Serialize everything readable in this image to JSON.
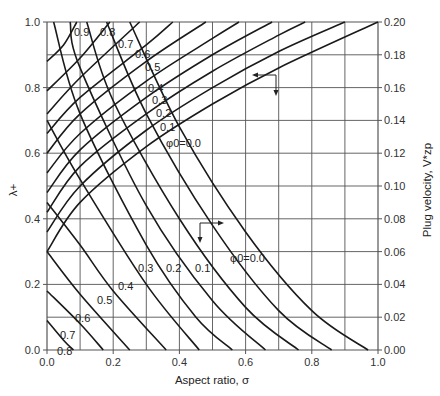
{
  "chart_data": {
    "type": "line",
    "title": "",
    "xlabel": "Aspect ratio, σ",
    "ylabel": "λ+",
    "ylabel_right": "Plug velocity, V*zp",
    "xlim": [
      0.0,
      1.0
    ],
    "ylim": [
      0.0,
      1.0
    ],
    "ylim_right": [
      0.0,
      0.2
    ],
    "grid": true,
    "x_ticks": [
      "0.0",
      "0.2",
      "0.4",
      "0.6",
      "0.8",
      "1.0"
    ],
    "y_ticks": [
      "0.0",
      "0.2",
      "0.4",
      "0.6",
      "0.8",
      "1.0"
    ],
    "y_right_ticks": [
      "0.00",
      "0.02",
      "0.04",
      "0.06",
      "0.08",
      "0.10",
      "0.12",
      "0.14",
      "0.16",
      "0.18",
      "0.20"
    ],
    "families": [
      {
        "name": "Plug velocity V*zp (right axis)",
        "arrow": "left",
        "series": [
          {
            "name": "φ0=0.0",
            "points": [
              [
                0.0,
                0.3
              ],
              [
                0.1,
                0.45
              ],
              [
                0.3,
                0.62
              ],
              [
                0.5,
                0.75
              ],
              [
                0.7,
                0.86
              ],
              [
                1.0,
                1.0
              ]
            ]
          },
          {
            "name": "0.1",
            "points": [
              [
                0.0,
                0.36
              ],
              [
                0.1,
                0.5
              ],
              [
                0.3,
                0.67
              ],
              [
                0.5,
                0.8
              ],
              [
                0.7,
                0.91
              ],
              [
                0.9,
                1.0
              ]
            ]
          },
          {
            "name": "0.2",
            "points": [
              [
                0.0,
                0.42
              ],
              [
                0.1,
                0.56
              ],
              [
                0.3,
                0.72
              ],
              [
                0.5,
                0.85
              ],
              [
                0.7,
                0.96
              ],
              [
                0.78,
                1.0
              ]
            ]
          },
          {
            "name": "0.3",
            "points": [
              [
                0.0,
                0.48
              ],
              [
                0.1,
                0.61
              ],
              [
                0.3,
                0.77
              ],
              [
                0.5,
                0.9
              ],
              [
                0.68,
                1.0
              ]
            ]
          },
          {
            "name": "0.4",
            "points": [
              [
                0.0,
                0.54
              ],
              [
                0.1,
                0.66
              ],
              [
                0.3,
                0.82
              ],
              [
                0.5,
                0.95
              ],
              [
                0.58,
                1.0
              ]
            ]
          },
          {
            "name": "0.5",
            "points": [
              [
                0.0,
                0.6
              ],
              [
                0.1,
                0.72
              ],
              [
                0.3,
                0.88
              ],
              [
                0.48,
                1.0
              ]
            ]
          },
          {
            "name": "0.6",
            "points": [
              [
                0.0,
                0.66
              ],
              [
                0.1,
                0.77
              ],
              [
                0.3,
                0.93
              ],
              [
                0.38,
                1.0
              ]
            ]
          },
          {
            "name": "0.7",
            "points": [
              [
                0.0,
                0.72
              ],
              [
                0.1,
                0.83
              ],
              [
                0.28,
                1.0
              ]
            ]
          },
          {
            "name": "0.8",
            "points": [
              [
                0.0,
                0.79
              ],
              [
                0.1,
                0.89
              ],
              [
                0.19,
                1.0
              ]
            ]
          },
          {
            "name": "0.9",
            "points": [
              [
                0.0,
                0.88
              ],
              [
                0.05,
                0.93
              ],
              [
                0.09,
                1.0
              ]
            ]
          }
        ]
      },
      {
        "name": "λ+ (left axis)",
        "arrow": "down",
        "series": [
          {
            "name": "φ0=0.0",
            "points": [
              [
                0.25,
                1.0
              ],
              [
                0.4,
                0.68
              ],
              [
                0.6,
                0.36
              ],
              [
                0.8,
                0.12
              ],
              [
                0.97,
                0.0
              ]
            ]
          },
          {
            "name": "0.1",
            "points": [
              [
                0.18,
                1.0
              ],
              [
                0.3,
                0.72
              ],
              [
                0.5,
                0.38
              ],
              [
                0.7,
                0.12
              ],
              [
                0.86,
                0.0
              ]
            ]
          },
          {
            "name": "0.2",
            "points": [
              [
                0.12,
                1.0
              ],
              [
                0.2,
                0.76
              ],
              [
                0.4,
                0.4
              ],
              [
                0.6,
                0.13
              ],
              [
                0.76,
                0.0
              ]
            ]
          },
          {
            "name": "0.3",
            "points": [
              [
                0.07,
                1.0
              ],
              [
                0.1,
                0.86
              ],
              [
                0.3,
                0.44
              ],
              [
                0.5,
                0.15
              ],
              [
                0.66,
                0.0
              ]
            ]
          },
          {
            "name": "0.4",
            "points": [
              [
                0.02,
                1.0
              ],
              [
                0.1,
                0.72
              ],
              [
                0.3,
                0.32
              ],
              [
                0.45,
                0.1
              ],
              [
                0.56,
                0.0
              ]
            ]
          },
          {
            "name": "0.5",
            "points": [
              [
                0.0,
                0.7
              ],
              [
                0.1,
                0.52
              ],
              [
                0.3,
                0.2
              ],
              [
                0.46,
                0.0
              ]
            ]
          },
          {
            "name": "0.6",
            "points": [
              [
                0.0,
                0.45
              ],
              [
                0.1,
                0.32
              ],
              [
                0.2,
                0.18
              ],
              [
                0.36,
                0.0
              ]
            ]
          },
          {
            "name": "0.7",
            "points": [
              [
                0.0,
                0.3
              ],
              [
                0.1,
                0.17
              ],
              [
                0.25,
                0.0
              ]
            ]
          },
          {
            "name": "0.8",
            "points": [
              [
                0.0,
                0.18
              ],
              [
                0.1,
                0.08
              ],
              [
                0.17,
                0.0
              ]
            ]
          },
          {
            "name": "0.9",
            "points": [
              [
                0.0,
                0.09
              ],
              [
                0.05,
                0.03
              ],
              [
                0.08,
                0.0
              ]
            ]
          }
        ]
      }
    ],
    "annotations": [
      "φ0=0.0 (upper family label)",
      "φ0=0.0 (lower family label)",
      "arrow left: read right axis",
      "arrow down: read σ axis"
    ]
  },
  "labels": {
    "x_axis": "Aspect ratio, σ",
    "y_axis_left": "λ+",
    "y_axis_right": "Plug velocity, V*zp",
    "upper_labels": [
      "0.9",
      "0.8",
      "0.7",
      "0.6",
      "0.5",
      "0.4",
      "0.3",
      "0.2",
      "0.1",
      "φ0=0.0"
    ],
    "lower_labels": [
      "0.3",
      "0.2",
      "0.1",
      "φ0=0.0",
      "0.4",
      "0.5",
      "0.6",
      "0.7",
      "0.8"
    ]
  }
}
